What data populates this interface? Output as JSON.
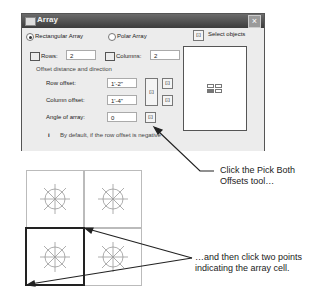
{
  "dialog": {
    "title": "Array",
    "close_label": "×",
    "radio_rectangular": "Rectangular Array",
    "radio_polar": "Polar Array",
    "selected_mode": "rectangular",
    "select_objects_label": "Select objects",
    "objects_selected": "0 objects selected",
    "rows_label": "Rows:",
    "rows_value": "2",
    "columns_label": "Columns:",
    "columns_value": "2",
    "offset_group_label": "Offset distance and direction",
    "row_offset_label": "Row offset:",
    "row_offset_value": "1'-2\"",
    "column_offset_label": "Column offset:",
    "column_offset_value": "1'-4\"",
    "angle_label": "Angle of array:",
    "angle_value": "0",
    "tip_icon": "i",
    "tip_text": "By default, if the row offset is negative"
  },
  "callouts": {
    "pick_both": "Click the Pick Both Offsets tool…",
    "two_points": "…and then click two points indicating the array cell."
  },
  "grid": {
    "rows": 2,
    "columns": 2,
    "highlighted_cell": "bottom-left"
  }
}
